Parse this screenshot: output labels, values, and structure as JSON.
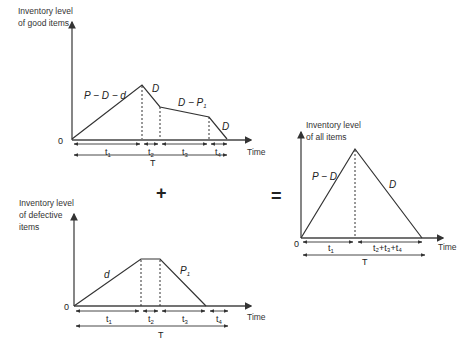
{
  "top_chart": {
    "ylabel_line1": "Inventory level",
    "ylabel_line2": "of good items",
    "origin": "0",
    "xlabel": "Time",
    "slopes": [
      "P − D − d",
      "D",
      "D − P",
      "1",
      "D"
    ],
    "intervals": [
      "t",
      "t",
      "t",
      "t"
    ],
    "interval_subs": [
      "1",
      "2",
      "3",
      "4"
    ],
    "total": "T"
  },
  "bottom_chart": {
    "ylabel_line1": "Inventory level",
    "ylabel_line2": "of defective",
    "ylabel_line3": "items",
    "origin": "0",
    "xlabel": "Time",
    "slope_up": "d",
    "slope_down": "P",
    "slope_down_sub": "1",
    "intervals": [
      "t",
      "t",
      "t",
      "t"
    ],
    "interval_subs": [
      "1",
      "2",
      "3",
      "4"
    ],
    "total": "T"
  },
  "right_chart": {
    "ylabel_line1": "Inventory level",
    "ylabel_line2": "of all items",
    "origin": "0",
    "xlabel": "Time",
    "slope_up": "P − D",
    "slope_down": "D",
    "interval1": "t",
    "interval1_sub": "1",
    "interval2": "t₂+t₃+t₄",
    "total": "T"
  },
  "operators": {
    "plus": "+",
    "equals": "="
  }
}
